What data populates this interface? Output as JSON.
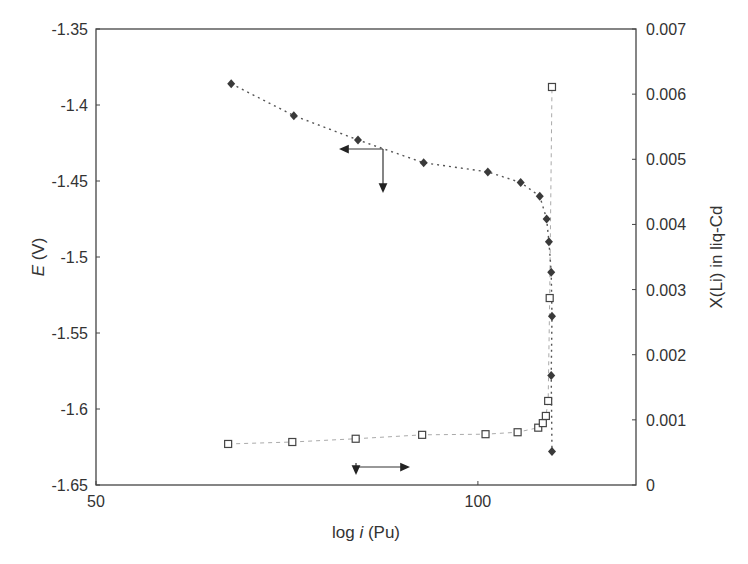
{
  "chart_data": {
    "type": "scatter",
    "title": "",
    "xlabel": "log i (Pu)",
    "xlabel_parts": {
      "prefix": "log ",
      "italic": "i",
      "suffix": " (Pu)"
    },
    "ylabel": "E (V)",
    "ylabel_parts": {
      "italic": "E",
      "suffix": " (V)"
    },
    "y2label": "X(Li) in liq-Cd",
    "xlim": [
      50,
      120.7
    ],
    "ylim": [
      -1.65,
      -1.35
    ],
    "y2lim": [
      0,
      0.007
    ],
    "grid": false,
    "legend": "none",
    "x_ticks": [
      {
        "value": 50,
        "label": "50"
      },
      {
        "value": 100,
        "label": "100"
      }
    ],
    "y_ticks": [
      {
        "value": -1.35,
        "label": "-1.35"
      },
      {
        "value": -1.4,
        "label": "-1.4"
      },
      {
        "value": -1.45,
        "label": "-1.45"
      },
      {
        "value": -1.5,
        "label": "-1.5"
      },
      {
        "value": -1.55,
        "label": "-1.55"
      },
      {
        "value": -1.6,
        "label": "-1.6"
      },
      {
        "value": -1.65,
        "label": "-1.65"
      }
    ],
    "y2_ticks": [
      {
        "value": 0.007,
        "label": "0.007"
      },
      {
        "value": 0.006,
        "label": "0.006"
      },
      {
        "value": 0.005,
        "label": "0.005"
      },
      {
        "value": 0.004,
        "label": "0.004"
      },
      {
        "value": 0.003,
        "label": "0.003"
      },
      {
        "value": 0.002,
        "label": "0.002"
      },
      {
        "value": 0.001,
        "label": "0.001"
      },
      {
        "value": 0,
        "label": "0"
      }
    ],
    "series": [
      {
        "name": "E (V)",
        "axis": "left",
        "marker": "filled-diamond",
        "line": "dotted",
        "color": "#333333",
        "x": [
          67.7,
          75.9,
          84.3,
          92.9,
          101.3,
          105.6,
          108.1,
          109.0,
          109.3,
          109.6,
          109.7,
          109.6,
          109.7
        ],
        "values": [
          -1.386,
          -1.407,
          -1.423,
          -1.438,
          -1.444,
          -1.451,
          -1.46,
          -1.475,
          -1.49,
          -1.51,
          -1.539,
          -1.578,
          -1.628
        ]
      },
      {
        "name": "X(Li) in liq-Cd",
        "axis": "right",
        "marker": "open-square",
        "line": "dashed-light",
        "color": "#555555",
        "x": [
          67.3,
          75.7,
          84.0,
          92.7,
          101.0,
          105.2,
          107.9,
          108.5,
          108.9,
          109.2,
          109.4,
          109.7
        ],
        "values": [
          0.00063,
          0.00066,
          0.00071,
          0.00077,
          0.00078,
          0.00081,
          0.00088,
          0.00095,
          0.00106,
          0.00129,
          0.00287,
          0.00611
        ]
      }
    ],
    "annotations": [
      {
        "type": "axis-pointer",
        "series": "E (V)",
        "points_to": [
          "left-axis",
          "down"
        ],
        "anchor": {
          "x": 88.3,
          "y": -1.436
        }
      },
      {
        "type": "axis-pointer",
        "series": "X(Li) in liq-Cd",
        "points_to": [
          "right",
          "down"
        ],
        "anchor": {
          "x": 84.0,
          "y2": 0.00071
        }
      }
    ]
  },
  "colors": {
    "axis": "#444444",
    "text": "#333333",
    "marker_filled": "#3a3a3a",
    "marker_open_stroke": "#444444",
    "connector_e": "#555555",
    "connector_x": "#aaaaaa"
  }
}
